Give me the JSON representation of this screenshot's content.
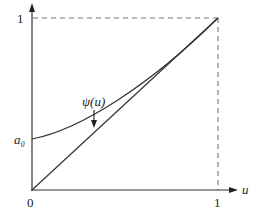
{
  "figure": {
    "axes": {
      "x_label": "u",
      "y_label": "",
      "x_ticks": [
        "0",
        "1"
      ],
      "y_ticks": [
        "1"
      ],
      "intercept_label": "a₀"
    },
    "curves": [
      {
        "name": "psi",
        "label": "ψ(u)",
        "from": [
          0,
          0.3
        ],
        "to": [
          1,
          1
        ],
        "shape": "convex curve"
      },
      {
        "name": "diagonal",
        "label": "",
        "from": [
          0,
          0
        ],
        "to": [
          1,
          1
        ],
        "shape": "straight line"
      }
    ],
    "guides": [
      "dashed horizontal at y=1",
      "dashed vertical at u=1"
    ],
    "annotation": {
      "text": "ψ(u)",
      "arrow": "down"
    },
    "colors": {
      "line": "#333333",
      "dash": "#777777"
    }
  }
}
